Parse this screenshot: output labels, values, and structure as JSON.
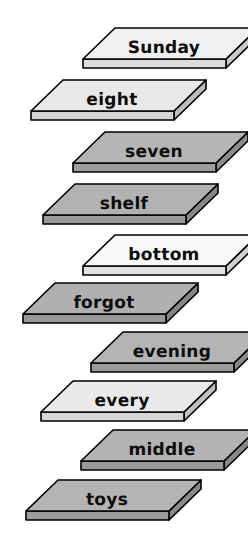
{
  "page": {
    "background_color": "#ffffff",
    "width": 248,
    "height": 554,
    "illustration_type": "isometric-shelf-stack",
    "item_count": 10
  },
  "palette": {
    "outline": "#000000",
    "surface_light": "#eeeeee",
    "surface_white": "#f7f7f7",
    "surface_medium": "#b5b5b5",
    "edge_light": "#dcdcdc",
    "edge_medium": "#9a9a9a",
    "side_light": "#c8c8c8",
    "side_medium": "#8a8a8a",
    "text": "#0d0d0d"
  },
  "shelves": [
    {
      "label": "Sunday",
      "x": 81,
      "y": 26,
      "tone": "light",
      "surface": "#f0f0f0",
      "edge": "#dcdcdc",
      "side": "#c9c9c9"
    },
    {
      "label": "eight",
      "x": 29,
      "y": 78,
      "tone": "light",
      "surface": "#e8e8e8",
      "edge": "#d4d4d4",
      "side": "#bdbdbd"
    },
    {
      "label": "seven",
      "x": 71,
      "y": 130,
      "tone": "medium",
      "surface": "#b5b5b5",
      "edge": "#9c9c9c",
      "side": "#8a8a8a"
    },
    {
      "label": "shelf",
      "x": 41,
      "y": 182,
      "tone": "medium",
      "surface": "#b2b2b2",
      "edge": "#999999",
      "side": "#878787"
    },
    {
      "label": "bottom",
      "x": 81,
      "y": 233,
      "tone": "white",
      "surface": "#f8f8f8",
      "edge": "#e2e2e2",
      "side": "#cfcfcf"
    },
    {
      "label": "forgot",
      "x": 21,
      "y": 281,
      "tone": "medium",
      "surface": "#b0b0b0",
      "edge": "#989898",
      "side": "#858585"
    },
    {
      "label": "evening",
      "x": 89,
      "y": 330,
      "tone": "medium",
      "surface": "#b4b4b4",
      "edge": "#9b9b9b",
      "side": "#898989"
    },
    {
      "label": "every",
      "x": 39,
      "y": 379,
      "tone": "light",
      "surface": "#eaeaea",
      "edge": "#d6d6d6",
      "side": "#bfbfbf"
    },
    {
      "label": "middle",
      "x": 79,
      "y": 428,
      "tone": "medium",
      "surface": "#b3b3b3",
      "edge": "#9a9a9a",
      "side": "#888888"
    },
    {
      "label": "toys",
      "x": 24,
      "y": 478,
      "tone": "medium",
      "surface": "#b4b4b4",
      "edge": "#9b9b9b",
      "side": "#898989"
    }
  ]
}
